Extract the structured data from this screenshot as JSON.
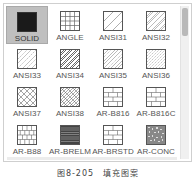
{
  "palette": {
    "selected": "SOLID",
    "items": [
      {
        "label": "SOLID",
        "pattern": "solid"
      },
      {
        "label": "ANGLE",
        "pattern": "grid"
      },
      {
        "label": "ANSI31",
        "pattern": "diag-sparse"
      },
      {
        "label": "ANSI32",
        "pattern": "diag-double"
      },
      {
        "label": "ANSI33",
        "pattern": "diag-dash"
      },
      {
        "label": "ANSI34",
        "pattern": "diag-dense"
      },
      {
        "label": "ANSI35",
        "pattern": "diag-mixed"
      },
      {
        "label": "ANSI36",
        "pattern": "diag-dotted"
      },
      {
        "label": "ANSI37",
        "pattern": "crosshatch"
      },
      {
        "label": "ANSI38",
        "pattern": "crosshatch-dense"
      },
      {
        "label": "AR-B816",
        "pattern": "brick"
      },
      {
        "label": "AR-B816C",
        "pattern": "brick"
      },
      {
        "label": "AR-B88",
        "pattern": "brick-small"
      },
      {
        "label": "AR-BRELM",
        "pattern": "brick-dense"
      },
      {
        "label": "AR-BRSTD",
        "pattern": "brick"
      },
      {
        "label": "AR-CONC",
        "pattern": "concrete"
      }
    ]
  },
  "scrollbar": {
    "position_percent": 0
  },
  "caption": "图8-205　填充图案",
  "colors": {
    "selected_bg": "#bfbfbf",
    "solid_fill": "#1a1a1a",
    "line": "#555555"
  }
}
